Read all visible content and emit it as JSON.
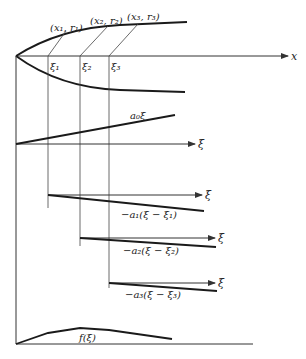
{
  "figure": {
    "x_axis_label": "x",
    "points_labels": [
      "(x₁, r₁)",
      "(x₂, r₂)",
      "(x₃, r₃)"
    ],
    "xi_labels": [
      "ξ₁",
      "ξ₂",
      "ξ₃"
    ],
    "panel_axis_label": "ξ",
    "term_labels": {
      "a0": "a₀ξ",
      "a1": "−a₁(ξ − ξ₁)",
      "a2": "−a₂(ξ − ξ₂)",
      "a3": "−a₃(ξ − ξ₃)"
    },
    "sum_label": "f(ξ)"
  },
  "colors": {
    "ink": "#1a1a1a",
    "background": "#ffffff"
  }
}
